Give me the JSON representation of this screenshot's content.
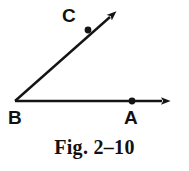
{
  "figure": {
    "caption": "Fig. 2–10",
    "background_color": "#ffffff",
    "ink_color": "#141414",
    "width": 189,
    "height": 171
  },
  "geometry": {
    "type": "angle-diagram",
    "description": "An angle with vertex B, a horizontal ray through point A, and an upward-slanting ray through point C.",
    "vertex": {
      "name": "B",
      "label": "B",
      "x": 15,
      "y": 101
    },
    "rays": [
      {
        "name": "ray-BA",
        "from": "B",
        "through": "A",
        "start_x": 15,
        "start_y": 101,
        "end_x": 171,
        "end_y": 101,
        "arrowhead": true,
        "direction_degrees": 0
      },
      {
        "name": "ray-BC",
        "from": "B",
        "through": "C",
        "start_x": 15,
        "start_y": 101,
        "end_x": 118,
        "end_y": 10,
        "arrowhead": true,
        "direction_degrees": 41
      }
    ],
    "points": [
      {
        "name": "A",
        "label": "A",
        "x": 132,
        "y": 101,
        "label_x": 132,
        "label_y": 119,
        "marker": "filled-dot"
      },
      {
        "name": "C",
        "label": "C",
        "x": 88,
        "y": 30,
        "label_x": 70,
        "label_y": 17,
        "marker": "filled-dot"
      }
    ]
  }
}
